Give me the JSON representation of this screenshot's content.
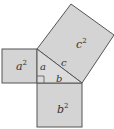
{
  "diagram": {
    "colors": {
      "fill": "#d4d4d4",
      "stroke": "#555555",
      "text": "#333333"
    },
    "squares": [
      {
        "id": "a-squared",
        "base": "a",
        "exp": "2"
      },
      {
        "id": "b-squared",
        "base": "b",
        "exp": "2"
      },
      {
        "id": "c-squared",
        "base": "c",
        "exp": "2"
      }
    ],
    "triangle": {
      "side_labels": {
        "a": "a",
        "b": "b",
        "c": "c"
      },
      "right_angle": true
    }
  }
}
